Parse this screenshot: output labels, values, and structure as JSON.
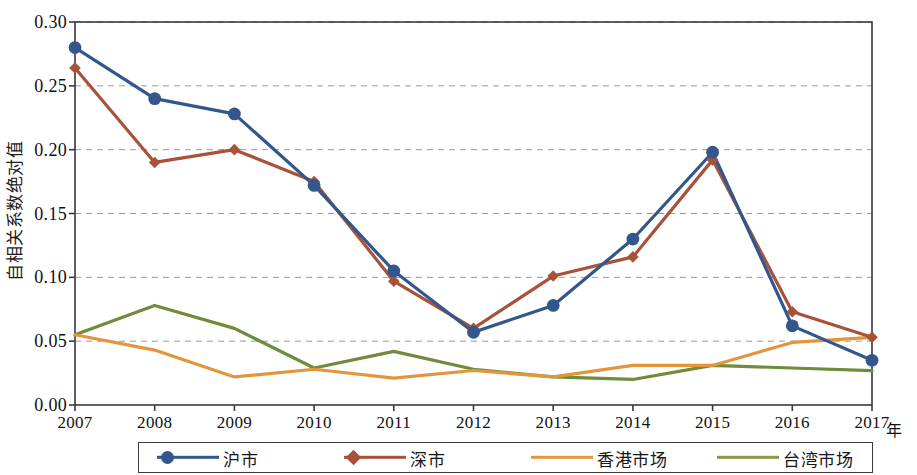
{
  "chart_data": {
    "type": "line",
    "title": "",
    "subtitle": "",
    "xlabel": "年",
    "ylabel": "自相关系数绝对值",
    "x": [
      2007,
      2008,
      2009,
      2010,
      2011,
      2012,
      2013,
      2014,
      2015,
      2016,
      2017
    ],
    "categories": [
      "2007",
      "2008",
      "2009",
      "2010",
      "2011",
      "2012",
      "2013",
      "2014",
      "2015",
      "2016",
      "2017"
    ],
    "xlim": [
      2007,
      2017
    ],
    "ylim": [
      0.0,
      0.3
    ],
    "ytick_labels": [
      "0.00",
      "0.05",
      "0.10",
      "0.15",
      "0.20",
      "0.25",
      "0.30"
    ],
    "ytick_values": [
      0.0,
      0.05,
      0.1,
      0.15,
      0.2,
      0.25,
      0.3
    ],
    "grid": "horizontal-dashed",
    "legend_position": "bottom",
    "series": [
      {
        "name": "沪市",
        "color": "#33568C",
        "marker": "circle",
        "values": [
          0.28,
          0.24,
          0.228,
          0.172,
          0.105,
          0.057,
          0.078,
          0.13,
          0.198,
          0.062,
          0.035
        ]
      },
      {
        "name": "深市",
        "color": "#A8523A",
        "marker": "diamond",
        "values": [
          0.264,
          0.19,
          0.2,
          0.175,
          0.097,
          0.06,
          0.101,
          0.116,
          0.192,
          0.073,
          0.053
        ]
      },
      {
        "name": "香港市场",
        "color": "#E3953C",
        "marker": "none",
        "values": [
          0.055,
          0.043,
          0.022,
          0.028,
          0.021,
          0.027,
          0.022,
          0.031,
          0.031,
          0.049,
          0.053
        ]
      },
      {
        "name": "台湾市场",
        "color": "#6E8C3A",
        "marker": "none",
        "values": [
          0.055,
          0.078,
          0.06,
          0.029,
          0.042,
          0.028,
          0.022,
          0.02,
          0.031,
          0.029,
          0.027
        ]
      }
    ]
  },
  "axes": {
    "y_axis_label": "自相关系数绝对值",
    "x_axis_unit": "年"
  },
  "legend": {
    "items": [
      {
        "label": "沪市",
        "color": "#33568C",
        "marker": "circle"
      },
      {
        "label": "深市",
        "color": "#A8523A",
        "marker": "diamond"
      },
      {
        "label": "香港市场",
        "color": "#E3953C",
        "marker": "none"
      },
      {
        "label": "台湾市场",
        "color": "#8A9B3D",
        "marker": "none"
      }
    ]
  },
  "colors": {
    "series_shanghai": "#33568C",
    "series_shenzhen": "#A8523A",
    "series_hongkong": "#E3953C",
    "series_taiwan": "#6E8C3A",
    "axis": "#3a3a3a",
    "grid": "#9a9a9a",
    "background": "#ffffff"
  }
}
